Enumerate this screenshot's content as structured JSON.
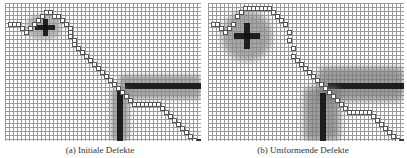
{
  "figure": {
    "panels": [
      {
        "id": "a",
        "caption": "(a) Initiale Defekte",
        "obstacles": [
          {
            "name": "plus-halo",
            "x": 22,
            "y": 12,
            "w": 34,
            "h": 24,
            "color": "#9a9a9a",
            "blur": 2,
            "round": 10
          },
          {
            "name": "plus-h",
            "x": 30,
            "y": 22,
            "w": 20,
            "h": 5,
            "color": "#111"
          },
          {
            "name": "plus-v",
            "x": 38,
            "y": 16,
            "w": 5,
            "h": 17,
            "color": "#111"
          },
          {
            "name": "wall-h-halo",
            "x": 114,
            "y": 72,
            "w": 82,
            "h": 24,
            "color": "#8a8a8a",
            "blur": 2,
            "round": 4
          },
          {
            "name": "wall-h",
            "x": 120,
            "y": 80,
            "w": 76,
            "h": 6,
            "color": "#111"
          },
          {
            "name": "wall-v-halo",
            "x": 106,
            "y": 86,
            "w": 18,
            "h": 52,
            "color": "#8a8a8a",
            "blur": 2,
            "round": 4
          },
          {
            "name": "wall-v",
            "x": 112,
            "y": 88,
            "w": 6,
            "h": 50,
            "color": "#111"
          }
        ],
        "path": [
          [
            4,
            20
          ],
          [
            8,
            20
          ],
          [
            12,
            20
          ],
          [
            16,
            24
          ],
          [
            20,
            28
          ],
          [
            24,
            24
          ],
          [
            28,
            20
          ],
          [
            32,
            16
          ],
          [
            36,
            12
          ],
          [
            40,
            8
          ],
          [
            44,
            8
          ],
          [
            48,
            12
          ],
          [
            52,
            12
          ],
          [
            56,
            16
          ],
          [
            60,
            20
          ],
          [
            64,
            24
          ],
          [
            64,
            28
          ],
          [
            64,
            32
          ],
          [
            68,
            36
          ],
          [
            68,
            40
          ],
          [
            72,
            44
          ],
          [
            76,
            48
          ],
          [
            80,
            52
          ],
          [
            84,
            56
          ],
          [
            88,
            60
          ],
          [
            92,
            64
          ],
          [
            96,
            68
          ],
          [
            100,
            72
          ],
          [
            104,
            76
          ],
          [
            108,
            80
          ],
          [
            112,
            84
          ],
          [
            116,
            88
          ],
          [
            120,
            92
          ],
          [
            124,
            96
          ],
          [
            128,
            100
          ],
          [
            132,
            100
          ],
          [
            136,
            100
          ],
          [
            140,
            100
          ],
          [
            144,
            100
          ],
          [
            148,
            100
          ],
          [
            152,
            100
          ],
          [
            156,
            104
          ],
          [
            160,
            108
          ],
          [
            164,
            112
          ],
          [
            168,
            116
          ],
          [
            172,
            120
          ],
          [
            176,
            124
          ],
          [
            180,
            128
          ],
          [
            184,
            132
          ],
          [
            188,
            136
          ]
        ],
        "goal": [
          192,
          136
        ]
      },
      {
        "id": "b",
        "caption": "(b) Umformende Defekte",
        "obstacles": [
          {
            "name": "plus-halo",
            "x": 14,
            "y": 8,
            "w": 50,
            "h": 50,
            "color": "#8a8a8a",
            "blur": 3,
            "round": 24
          },
          {
            "name": "plus-h",
            "x": 26,
            "y": 30,
            "w": 26,
            "h": 6,
            "color": "#111"
          },
          {
            "name": "plus-v",
            "x": 36,
            "y": 20,
            "w": 6,
            "h": 26,
            "color": "#111"
          },
          {
            "name": "wall-h-halo",
            "x": 110,
            "y": 64,
            "w": 86,
            "h": 34,
            "color": "#7a7a7a",
            "blur": 3,
            "round": 6
          },
          {
            "name": "wall-h",
            "x": 120,
            "y": 80,
            "w": 76,
            "h": 6,
            "color": "#111"
          },
          {
            "name": "wall-v-halo",
            "x": 96,
            "y": 84,
            "w": 36,
            "h": 54,
            "color": "#7a7a7a",
            "blur": 3,
            "round": 6
          },
          {
            "name": "wall-v",
            "x": 112,
            "y": 90,
            "w": 6,
            "h": 48,
            "color": "#111"
          }
        ],
        "path": [
          [
            4,
            20
          ],
          [
            8,
            20
          ],
          [
            12,
            24
          ],
          [
            16,
            28
          ],
          [
            20,
            24
          ],
          [
            24,
            20
          ],
          [
            28,
            12
          ],
          [
            32,
            8
          ],
          [
            36,
            4
          ],
          [
            40,
            4
          ],
          [
            44,
            4
          ],
          [
            48,
            4
          ],
          [
            52,
            4
          ],
          [
            56,
            4
          ],
          [
            60,
            4
          ],
          [
            64,
            8
          ],
          [
            68,
            12
          ],
          [
            72,
            16
          ],
          [
            76,
            20
          ],
          [
            80,
            28
          ],
          [
            80,
            36
          ],
          [
            84,
            44
          ],
          [
            84,
            52
          ],
          [
            88,
            56
          ],
          [
            92,
            60
          ],
          [
            96,
            64
          ],
          [
            100,
            68
          ],
          [
            104,
            72
          ],
          [
            108,
            76
          ],
          [
            112,
            80
          ],
          [
            116,
            84
          ],
          [
            120,
            88
          ],
          [
            124,
            92
          ],
          [
            128,
            96
          ],
          [
            132,
            100
          ],
          [
            136,
            104
          ],
          [
            140,
            108
          ],
          [
            144,
            108
          ],
          [
            148,
            108
          ],
          [
            152,
            108
          ],
          [
            156,
            108
          ],
          [
            160,
            108
          ],
          [
            164,
            112
          ],
          [
            168,
            116
          ],
          [
            172,
            120
          ],
          [
            176,
            124
          ],
          [
            180,
            128
          ],
          [
            184,
            132
          ],
          [
            188,
            136
          ]
        ],
        "goal": [
          192,
          136
        ]
      }
    ]
  }
}
